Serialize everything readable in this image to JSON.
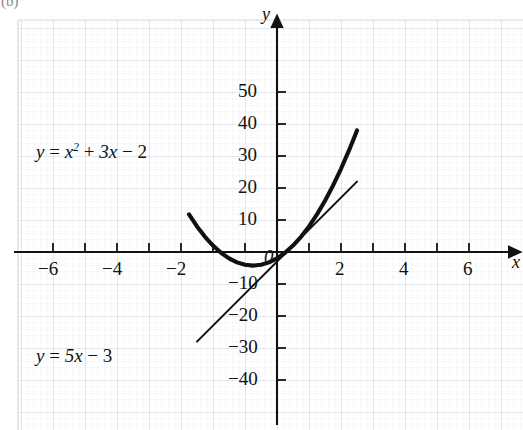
{
  "figure": {
    "part_label": "(b)",
    "background": "#ffffff",
    "grid_color_minor": "#e9eef2",
    "grid_color_major": "#d3dadf",
    "axis_color": "#111111",
    "curve_color": "#111111"
  },
  "axes": {
    "x_name": "x",
    "y_name": "y",
    "origin_label": "0",
    "x_ticks": [
      {
        "value": -6,
        "label": "−6"
      },
      {
        "value": -4,
        "label": "−4"
      },
      {
        "value": -2,
        "label": "−2"
      },
      {
        "value": 2,
        "label": "2"
      },
      {
        "value": 4,
        "label": "4"
      },
      {
        "value": 6,
        "label": "6"
      }
    ],
    "y_ticks": [
      {
        "value": 50,
        "label": "50"
      },
      {
        "value": 40,
        "label": "40"
      },
      {
        "value": 30,
        "label": "30"
      },
      {
        "value": 20,
        "label": "20"
      },
      {
        "value": 10,
        "label": "10"
      },
      {
        "value": -10,
        "label": "−10"
      },
      {
        "value": -20,
        "label": "−20"
      },
      {
        "value": -30,
        "label": "−30"
      },
      {
        "value": -40,
        "label": "−40"
      }
    ]
  },
  "labels": {
    "parabola": {
      "lhs": "y",
      "eq": "=",
      "var": "x",
      "power": "2",
      "plus": "+",
      "term2": "3x",
      "minus": "−",
      "const": "2",
      "full": "y = x² + 3x − 2"
    },
    "line": {
      "lhs": "y",
      "eq": "=",
      "term": "5x",
      "minus": "−",
      "const": "3",
      "full": "y = 5x − 3"
    }
  },
  "chart_data": {
    "type": "line",
    "title": "",
    "xlabel": "x",
    "ylabel": "y",
    "xlim": [
      -7.6,
      7.7
    ],
    "ylim": [
      -48,
      58
    ],
    "grid": true,
    "grid_style": "graph-paper",
    "legend": "inline-annotations",
    "xticks": [
      -6,
      -4,
      -2,
      2,
      4,
      6
    ],
    "yticks": [
      50,
      40,
      30,
      20,
      10,
      -10,
      -20,
      -30,
      -40
    ],
    "series": [
      {
        "name": "y = x² + 3x − 2",
        "equation": "y = x^2 + 3x - 2",
        "kind": "parabola",
        "linewidth": "thick",
        "color": "#111111",
        "x_domain": [
          -5.5,
          5.0
        ],
        "x": [
          -5.5,
          -5.0,
          -4.5,
          -4.0,
          -3.5,
          -3.0,
          -2.5,
          -2.0,
          -1.5,
          -1.0,
          -0.5,
          0.0,
          0.5,
          1.0,
          1.5,
          2.0,
          2.5,
          3.0,
          3.5,
          4.0,
          4.5,
          5.0
        ],
        "y": [
          11.75,
          8.0,
          4.75,
          2.0,
          -0.25,
          -2.0,
          -3.25,
          -4.0,
          -4.25,
          -4.0,
          -3.25,
          -2.0,
          -0.25,
          2.0,
          4.75,
          8.0,
          11.75,
          16.0,
          20.75,
          26.0,
          31.75,
          38.0
        ]
      },
      {
        "name": "y = 5x − 3",
        "equation": "y = 5x - 3",
        "kind": "straight-line",
        "linewidth": "thin",
        "color": "#111111",
        "slope": 5,
        "intercept": -3,
        "x_domain": [
          -5.0,
          5.0
        ],
        "x": [
          -5.0,
          5.0
        ],
        "y": [
          -28.0,
          22.0
        ]
      }
    ],
    "annotations": [
      {
        "text": "y = x² + 3x − 2",
        "x": -5.9,
        "y": 17
      },
      {
        "text": "y = 5x − 3",
        "x": -5.9,
        "y": -31
      }
    ],
    "intersections": [
      {
        "x": -0.21,
        "y": -4.05
      },
      {
        "x": 4.79,
        "y": 20.95
      }
    ]
  }
}
